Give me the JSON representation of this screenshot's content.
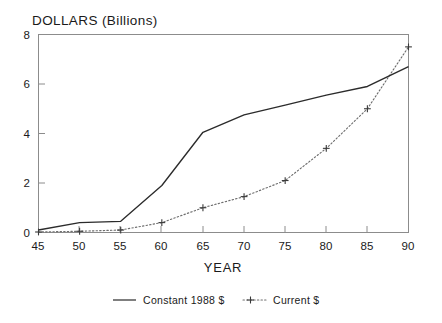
{
  "chart_data": {
    "type": "line",
    "title": "DOLLARS (Billions)",
    "xlabel": "YEAR",
    "ylabel": "",
    "x": [
      45,
      50,
      55,
      60,
      65,
      70,
      75,
      80,
      85,
      90
    ],
    "xticklabels": [
      "45",
      "50",
      "55",
      "60",
      "65",
      "70",
      "75",
      "80",
      "85",
      "90"
    ],
    "yticklabels": [
      "0",
      "2",
      "4",
      "6",
      "8"
    ],
    "yticks": [
      0,
      2,
      4,
      6,
      8
    ],
    "xlim": [
      45,
      90
    ],
    "ylim": [
      0,
      8
    ],
    "grid": false,
    "legend_position": "below",
    "series": [
      {
        "name": "Constant 1988 $",
        "style": "solid",
        "marker": "none",
        "values": [
          0.1,
          0.4,
          0.45,
          1.9,
          4.05,
          4.75,
          5.15,
          5.55,
          5.9,
          6.7
        ]
      },
      {
        "name": "Current $",
        "style": "dotted",
        "marker": "plus",
        "values": [
          0.02,
          0.05,
          0.1,
          0.4,
          1.0,
          1.45,
          2.1,
          3.4,
          5.0,
          7.5
        ]
      }
    ]
  },
  "legend": {
    "items": [
      {
        "label": "Constant 1988 $",
        "swatch": "solid-line-swatch"
      },
      {
        "label": "Current $",
        "swatch": "dotted-plus-swatch"
      }
    ]
  },
  "colors": {
    "background": "#ffffff",
    "frame": "#8c8c8c",
    "series_constant": "#2b2b2b",
    "series_current": "#6e6e6e",
    "text": "#1a1a1a"
  }
}
